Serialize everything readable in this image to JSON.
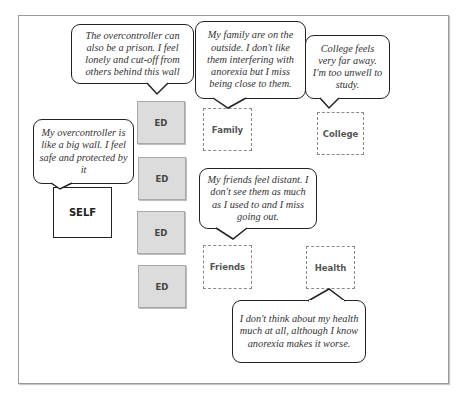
{
  "diagram": {
    "nodes": {
      "self": {
        "label": "SELF"
      },
      "ed": [
        {
          "label": "ED"
        },
        {
          "label": "ED"
        },
        {
          "label": "ED"
        },
        {
          "label": "ED"
        }
      ],
      "family": {
        "label": "Family"
      },
      "college": {
        "label": "College"
      },
      "friends": {
        "label": "Friends"
      },
      "health": {
        "label": "Health"
      }
    },
    "bubbles": {
      "prison": "The overcontroller can also be a prison. I feel lonely and cut-off from others behind this wall",
      "family": "My family are on the outside. I don't like them interfering with anorexia but I miss being close to them.",
      "college": "College feels very far away. I'm too unwell to study.",
      "self": "My overcontroller is like a big wall. I feel safe and protected by it",
      "friends": "My friends feel distant. I don't see them as much as I used to and I miss going out.",
      "health": "I don't think about my health much at all, although I know anorexia makes it worse."
    },
    "colors": {
      "ed_fill": "#dcdcdc",
      "bubble_border": "#222222",
      "dashed_border": "#8a8a8a"
    }
  }
}
